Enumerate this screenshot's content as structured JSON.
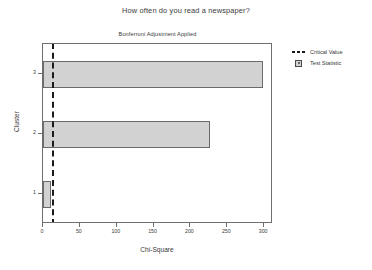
{
  "chart_data": {
    "type": "bar",
    "orientation": "horizontal",
    "title": "How often do you read a newspaper?",
    "subtitle": "Bonferroni Adjustment Applied",
    "xlabel": "Chi-Square",
    "ylabel": "Cluster",
    "categories": [
      "1",
      "2",
      "3"
    ],
    "values": [
      11,
      226,
      299
    ],
    "series": [
      {
        "name": "Test Statistic",
        "values": [
          11,
          226,
          299
        ]
      }
    ],
    "annotations": [
      {
        "name": "Critical Value",
        "type": "vline",
        "value": 12
      }
    ],
    "xlim": [
      0,
      312
    ],
    "ylim_categories": [
      "1",
      "2",
      "3"
    ],
    "xticks": [
      0,
      50,
      100,
      150,
      200,
      250,
      300
    ],
    "xticklabels": [
      "0",
      "50",
      "100",
      "150",
      "200",
      "250",
      "300"
    ],
    "yticks": [
      "1",
      "2",
      "3"
    ],
    "yticklabels": [
      "1",
      "2",
      "3"
    ],
    "grid": false,
    "legend_position": "right-top",
    "legend": [
      {
        "label": "Critical Value",
        "marker": "dashed-line"
      },
      {
        "label": "Test Statistic",
        "marker": "filled-square"
      }
    ],
    "colors": {
      "bar_fill": "#d2d2d2",
      "bar_edge": "#6a6a6a",
      "critical_line": "#1a1a1a",
      "axis": "#6f6f6f",
      "text": "#3a3a3a",
      "background": "#ffffff"
    }
  }
}
